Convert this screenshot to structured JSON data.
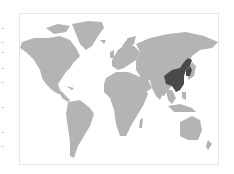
{
  "map": {
    "type": "world-map",
    "projection": "equirectangular-like",
    "land_color": "#b4b4b4",
    "highlight_color": "#4a4a4a",
    "frame_color": "#e6e6e6",
    "background": "#ffffff",
    "highlighted_regions": [
      "China",
      "Korea"
    ]
  }
}
